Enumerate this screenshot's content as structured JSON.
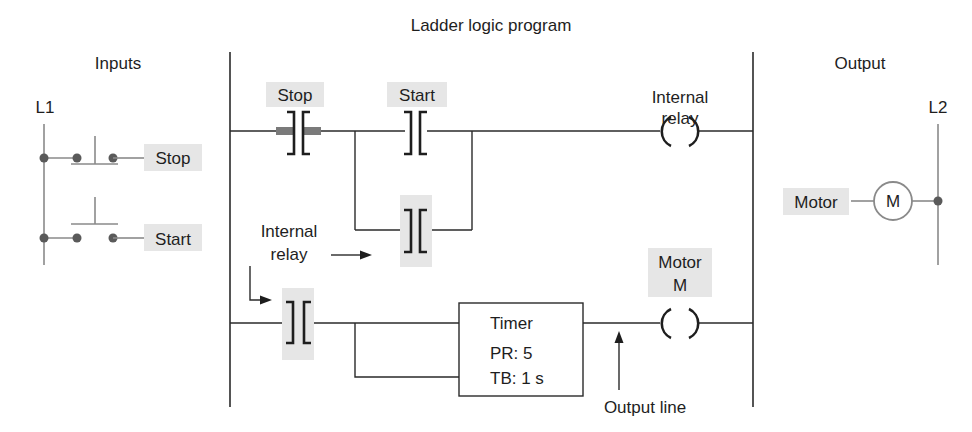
{
  "title": "Ladder logic program",
  "sections": {
    "inputs": "Inputs",
    "output": "Output"
  },
  "rails": {
    "left": "L1",
    "right": "L2"
  },
  "field_inputs": [
    {
      "label": "Stop",
      "type": "normally-closed pushbutton"
    },
    {
      "label": "Start",
      "type": "normally-open pushbutton"
    }
  ],
  "field_output": {
    "label": "Motor",
    "symbol": "M"
  },
  "rung1": {
    "stop_contact_label": "Stop",
    "start_contact_label": "Start",
    "coil_label_line1": "Internal",
    "coil_label_line2": "relay"
  },
  "annotations": {
    "internal_relay_line1": "Internal",
    "internal_relay_line2": "relay",
    "output_line": "Output line"
  },
  "rung2": {
    "timer": {
      "title": "Timer",
      "pr": "PR: 5",
      "tb": "TB: 1 s"
    },
    "coil_label_line1": "Motor",
    "coil_label_line2": "M"
  },
  "colors": {
    "highlight": "#e6e6e6",
    "active_bar": "#7a7a7a",
    "line": "#2a2a2a"
  }
}
